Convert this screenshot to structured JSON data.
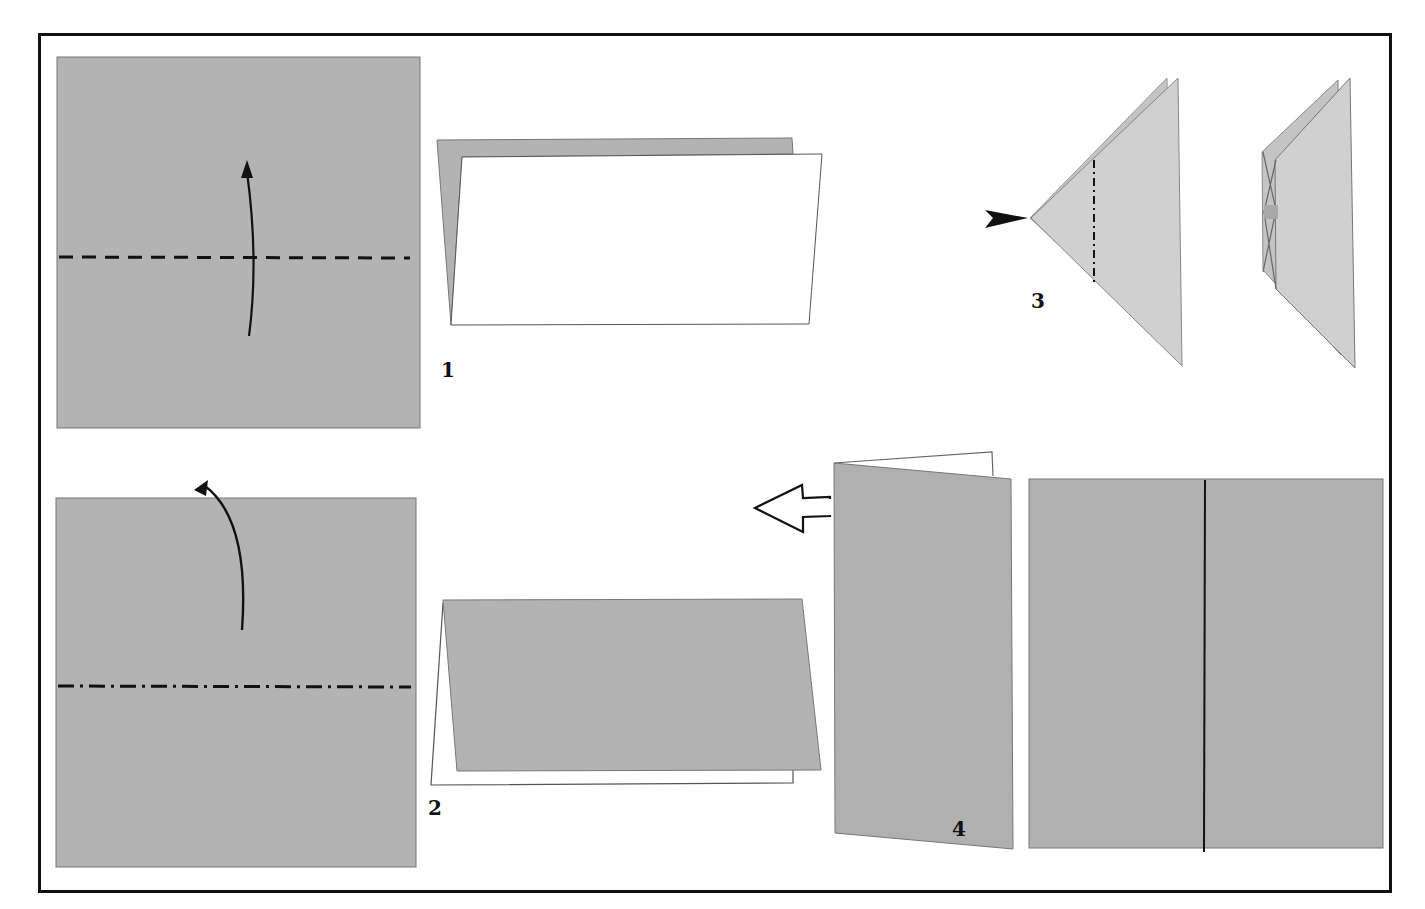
{
  "page": {
    "type": "origami-instruction-figure",
    "colors": {
      "paper_gray": "#b3b3b3",
      "paper_light": "#cfcfcf",
      "paper_white": "#ffffff",
      "line": "#111111",
      "frame": "#111111"
    }
  },
  "steps": [
    {
      "number": "1",
      "fold": "valley-fold",
      "line_style": "dashed",
      "arrow": "fold-up-arrow"
    },
    {
      "number": "2",
      "fold": "mountain-fold",
      "line_style": "dash-dot",
      "arrow": "fold-behind-arrow"
    },
    {
      "number": "3",
      "fold": "mountain-fold",
      "line_style": "dash-dot",
      "arrow": "push-in-arrow"
    },
    {
      "number": "4",
      "fold": "open",
      "line_style": "solid",
      "arrow": "hollow-left-arrow"
    }
  ]
}
